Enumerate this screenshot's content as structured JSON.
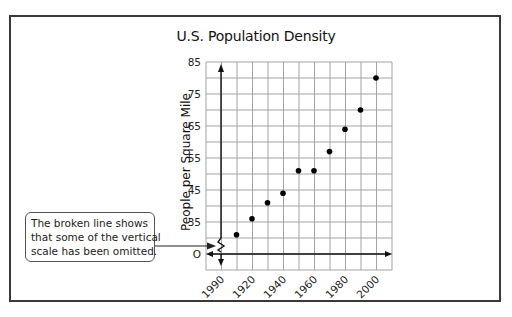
{
  "chart_data": {
    "type": "scatter",
    "title": "U.S. Population Density",
    "xlabel": "",
    "ylabel": "People per Square Mile",
    "x": [
      1910,
      1920,
      1930,
      1940,
      1950,
      1960,
      1970,
      1980,
      1990,
      2000
    ],
    "values": [
      31,
      36,
      41,
      44,
      51,
      51,
      57,
      64,
      70,
      80
    ],
    "series": [
      {
        "name": "Population Density",
        "x": [
          1910,
          1920,
          1930,
          1940,
          1950,
          1960,
          1970,
          1980,
          1990,
          2000
        ],
        "values": [
          31,
          36,
          41,
          44,
          51,
          51,
          57,
          64,
          70,
          80
        ]
      }
    ],
    "x_tick_labels": [
      "1990",
      "1920",
      "1940",
      "1960",
      "1980",
      "2000"
    ],
    "y_tick_labels": [
      "85",
      "75",
      "65",
      "55",
      "45",
      "35",
      "O"
    ],
    "ylim": [
      0,
      85
    ],
    "xlim": [
      1895,
      2015
    ],
    "y_axis_break": true,
    "grid": true,
    "legend": null,
    "annotation": "The broken line shows that some of the vertical scale has been omitted."
  },
  "title": "U.S. Population Density",
  "y_axis_title": "People per Square Mile",
  "callout": {
    "lines": [
      "The broken line shows",
      "that some of the vertical",
      "scale has been omitted."
    ]
  },
  "y_ticks": [
    {
      "label": "85",
      "y": 62
    },
    {
      "label": "75",
      "y": 94
    },
    {
      "label": "65",
      "y": 126
    },
    {
      "label": "55",
      "y": 158
    },
    {
      "label": "45",
      "y": 190
    },
    {
      "label": "35",
      "y": 222
    },
    {
      "label": "O",
      "y": 254
    }
  ],
  "x_ticks": [
    {
      "label": "1990",
      "x": 221
    },
    {
      "label": "1920",
      "x": 252
    },
    {
      "label": "1940",
      "x": 283
    },
    {
      "label": "1960",
      "x": 314
    },
    {
      "label": "1980",
      "x": 345
    },
    {
      "label": "2000",
      "x": 376
    }
  ],
  "colors": {
    "grid": "#9a9a9a",
    "axis": "#111111",
    "point": "#000000",
    "frame": "#3a3a3a"
  }
}
